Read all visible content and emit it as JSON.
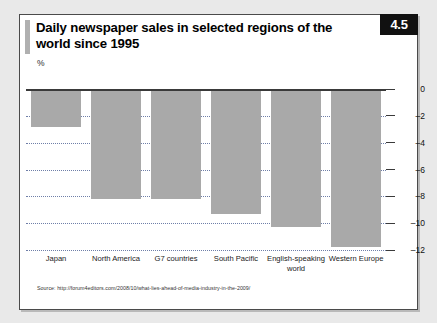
{
  "figure": {
    "badge": "4.5",
    "title": "Daily newspaper sales in selected regions of the world since 1995",
    "unit_label": "%",
    "source": "Source: http://forum4editors.com/2008/10/what-lies-ahead-of-media-industry-in-the-2009/"
  },
  "colors": {
    "bar": "#a9a9a9",
    "badge_bg": "#111111",
    "badge_text": "#ffffff",
    "gridline": "#6f7fa8",
    "axis": "#3a3a3a",
    "card_bg": "#ffffff",
    "page_bg": "#e9e9e9"
  },
  "chart_data": {
    "type": "bar",
    "title": "Daily newspaper sales in selected regions of the world since 1995",
    "xlabel": "",
    "ylabel": "%",
    "categories": [
      "Japan",
      "North America",
      "G7 countries",
      "South Pacific",
      "English-speaking world",
      "Western Europe"
    ],
    "values": [
      -2.8,
      -8.2,
      -8.2,
      -9.3,
      -10.3,
      -11.8
    ],
    "ylim": [
      -12,
      0
    ],
    "yticks": [
      0,
      -2,
      -4,
      -6,
      -8,
      -10,
      -12
    ],
    "ytick_labels": [
      "0",
      "–2",
      "–4",
      "–6",
      "–8",
      "–10",
      "–12"
    ],
    "grid": true,
    "legend": null,
    "orientation": "vertical"
  }
}
